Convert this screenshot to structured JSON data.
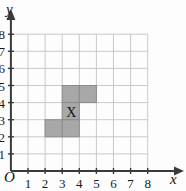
{
  "figure": {
    "background_color": "#fdfdfd",
    "grid_line_color": "#c9c9c9",
    "axis_color": "#3a3a3a",
    "shape_fill_color": "#a8a8a8",
    "shape_stroke_color": "#8a8a8a"
  },
  "axes": {
    "x_label": "x",
    "y_label": "y",
    "origin_label": "O",
    "x_ticks": [
      "1",
      "2",
      "3",
      "4",
      "5",
      "6",
      "7",
      "8"
    ],
    "y_ticks": [
      "1",
      "2",
      "3",
      "4",
      "5",
      "6",
      "7",
      "8"
    ],
    "x_range": [
      0,
      8
    ],
    "y_range": [
      0,
      8
    ]
  },
  "marker": {
    "label": "X",
    "cell_x": 3,
    "cell_y": 3
  },
  "chart_data": {
    "type": "grid",
    "title": "",
    "xlabel": "x",
    "ylabel": "y",
    "xlim": [
      0,
      8
    ],
    "ylim": [
      0,
      8
    ],
    "grid": true,
    "shaded_cells": [
      {
        "x": 3,
        "y": 4
      },
      {
        "x": 4,
        "y": 4
      },
      {
        "x": 3,
        "y": 3
      },
      {
        "x": 3,
        "y": 2
      },
      {
        "x": 2,
        "y": 2
      }
    ],
    "labels": [
      {
        "text": "X",
        "x": 3.5,
        "y": 3.5
      }
    ]
  }
}
